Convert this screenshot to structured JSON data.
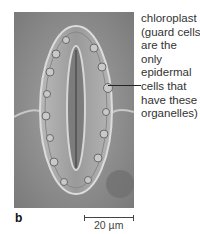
{
  "figure": {
    "panel_label": "b",
    "micrograph_alt": "Light micrograph of a stomate: two guard cells surrounding a central pore, with chloroplasts visible",
    "callout": {
      "text": "chloroplast (guard cells are the only epidermal cells that have these organelles)"
    },
    "scale_bar": {
      "label": "20 µm"
    }
  }
}
